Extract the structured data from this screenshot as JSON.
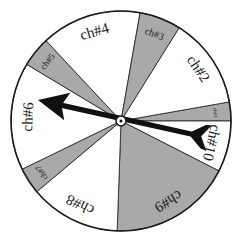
{
  "diagram": {
    "center": [
      121,
      121
    ],
    "radius": 110,
    "colors": {
      "shaded": "#a9a9a9",
      "unshaded": "#ffffff",
      "line": "#1a1a1a",
      "arrow": "#111111"
    },
    "sectors": [
      {
        "label": "ch#1",
        "start": 350,
        "end": 360,
        "shaded": true,
        "font": 5
      },
      {
        "label": "ch#10",
        "start": 0,
        "end": 27,
        "shaded": false,
        "font": 15
      },
      {
        "label": "ch#9",
        "start": 27,
        "end": 92,
        "shaded": true,
        "font": 15
      },
      {
        "label": "ch#8",
        "start": 92,
        "end": 140,
        "shaded": false,
        "font": 15
      },
      {
        "label": "ch#7",
        "start": 140,
        "end": 154,
        "shaded": true,
        "font": 8
      },
      {
        "label": "ch#6",
        "start": 154,
        "end": 211,
        "shaded": false,
        "font": 15
      },
      {
        "label": "ch#5",
        "start": 211,
        "end": 227,
        "shaded": true,
        "font": 9
      },
      {
        "label": "ch#4",
        "start": 227,
        "end": 280,
        "shaded": false,
        "font": 15
      },
      {
        "label": "ch#3",
        "start": 280,
        "end": 302,
        "shaded": true,
        "font": 10
      },
      {
        "label": "ch#2",
        "start": 302,
        "end": 350,
        "shaded": false,
        "font": 15
      }
    ],
    "pointer": {
      "tip": [
        38,
        100
      ],
      "tail": [
        209,
        138
      ]
    }
  }
}
